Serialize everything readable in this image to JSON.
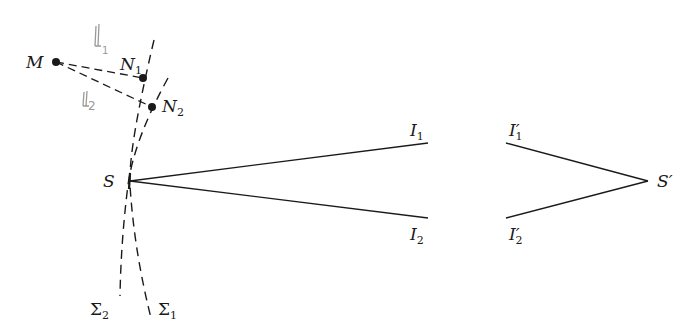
{
  "diagram": {
    "type": "optics-wavefront-ray-diagram",
    "points": {
      "M": {
        "label": "M",
        "x": 56,
        "y": 62
      },
      "N1": {
        "label": "N",
        "sub": "1",
        "x": 143,
        "y": 78
      },
      "N2": {
        "label": "N",
        "sub": "2",
        "x": 152,
        "y": 107
      },
      "S": {
        "label": "S",
        "x": 130,
        "y": 181
      },
      "S_prime": {
        "label": "S′",
        "x": 648,
        "y": 181
      }
    },
    "labels": {
      "I1": {
        "base": "I",
        "sub": "1"
      },
      "I2": {
        "base": "I",
        "sub": "2"
      },
      "I1p": {
        "base": "I′",
        "sub": "1"
      },
      "I2p": {
        "base": "I′",
        "sub": "2"
      },
      "Sigma1": {
        "base": "Σ",
        "sub": "1"
      },
      "Sigma2": {
        "base": "Σ",
        "sub": "2"
      }
    },
    "handwritten": {
      "l1": {
        "base": "l",
        "sub": "1"
      },
      "l2": {
        "base": "l",
        "sub": "2"
      }
    },
    "colors": {
      "ink": "#1a1a1a",
      "pencil": "#9a9a9a",
      "background": "#ffffff"
    }
  }
}
